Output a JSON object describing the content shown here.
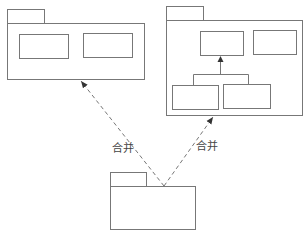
{
  "diagram": {
    "type": "uml-package-merge",
    "colors": {
      "stroke": "#777777",
      "text": "#444444",
      "background": "#ffffff"
    },
    "packages": [
      {
        "id": "left-package",
        "tab": [
          7,
          9,
          37,
          14
        ],
        "body": [
          7,
          23,
          137,
          56
        ],
        "classes": [
          [
            19,
            34,
            49,
            24
          ],
          [
            83,
            33,
            49,
            24
          ]
        ]
      },
      {
        "id": "right-package",
        "tab": [
          166,
          6,
          37,
          14
        ],
        "body": [
          166,
          20,
          136,
          95
        ],
        "classes": [
          [
            200,
            31,
            43,
            24
          ],
          [
            253,
            30,
            43,
            24
          ],
          [
            172,
            85,
            46,
            24
          ],
          [
            223,
            84,
            47,
            24
          ]
        ]
      },
      {
        "id": "bottom-package",
        "tab": [
          110,
          172,
          36,
          14
        ],
        "body": [
          110,
          186,
          85,
          43
        ],
        "classes": []
      }
    ],
    "dependencies": [
      {
        "from": "bottom-package",
        "to": "left-package",
        "label": "合并"
      },
      {
        "from": "bottom-package",
        "to": "right-package",
        "label": "合并"
      }
    ],
    "labels": {
      "left_merge": "合并",
      "right_merge": "合并"
    }
  }
}
